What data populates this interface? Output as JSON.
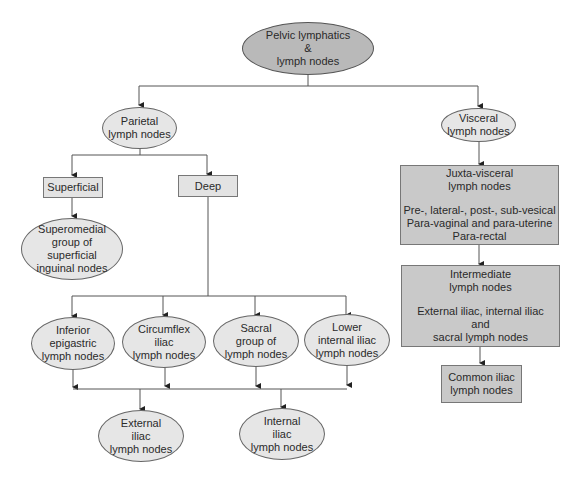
{
  "diagram": {
    "title": "Pelvic lymphatics\n&\nlymph nodes",
    "colors": {
      "root_fill": "#b9b9b9",
      "oval_fill": "#e6e6e6",
      "light_box_fill": "#e3e3e3",
      "dark_box_fill": "#c9c9c9",
      "line": "#555555"
    },
    "parietal": {
      "label": "Parietal\nlymph nodes",
      "superficial": {
        "label": "Superficial",
        "child": "Superomedial\ngroup of\nsuperficial\ninguinal nodes"
      },
      "deep": {
        "label": "Deep",
        "children": [
          "Inferior\nepigastric\nlymph nodes",
          "Circumflex\niliac\nlymph nodes",
          "Sacral\ngroup of\nlymph nodes",
          "Lower\ninternal iliac\nlymph nodes"
        ],
        "outputs": [
          "External\niliac\nlymph nodes",
          "Internal\niliac\nlymph nodes"
        ]
      }
    },
    "visceral": {
      "label": "Visceral\nlymph nodes",
      "juxta": {
        "title": "Juxta-visceral\nlymph nodes",
        "detail": "Pre-, lateral-, post-, sub-vesical\nPara-vaginal and para-uterine\nPara-rectal"
      },
      "intermediate": {
        "title": "Intermediate\nlymph nodes",
        "detail": "External iliac, internal iliac\nand\nsacral lymph nodes"
      },
      "common": "Common iliac\nlymph nodes"
    }
  }
}
